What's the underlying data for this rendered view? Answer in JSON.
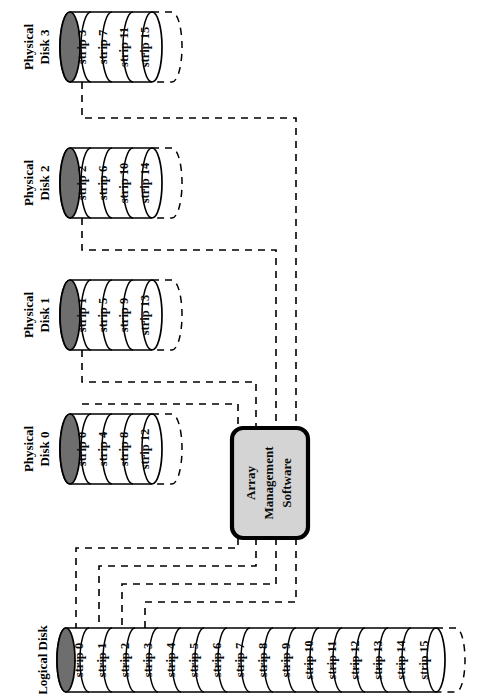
{
  "figure": {
    "orientation": "rotated-90-ccw",
    "background_color": "#ffffff",
    "line_color": "#000000",
    "cap_fill_color": "#6e6e6e",
    "box_fill_color": "#d4d4d4"
  },
  "array_management": {
    "line1": "Array",
    "line2": "Management",
    "line3": "Software"
  },
  "physical_disks": [
    {
      "title_line1": "Physical",
      "title_line2": "Disk 3",
      "strips": [
        "strip 3",
        "strip 7",
        "strip 11",
        "strip 15"
      ]
    },
    {
      "title_line1": "Physical",
      "title_line2": "Disk 2",
      "strips": [
        "strip 2",
        "strip 6",
        "strip 10",
        "strip 14"
      ]
    },
    {
      "title_line1": "Physical",
      "title_line2": "Disk 1",
      "strips": [
        "strip 1",
        "strip 5",
        "strip 9",
        "strip 13"
      ]
    },
    {
      "title_line1": "Physical",
      "title_line2": "Disk 0",
      "strips": [
        "strip 0",
        "strip 4",
        "strip 8",
        "strip 12"
      ]
    }
  ],
  "logical_disk": {
    "title": "Logical Disk",
    "strips": [
      "strip 0",
      "strip 1",
      "strip 2",
      "strip 3",
      "strip 4",
      "strip 5",
      "strip 6",
      "strip 7",
      "strip 8",
      "strip 9",
      "strip 10",
      "strip 11",
      "strip 12",
      "strip 13",
      "strip 14",
      "strip 15"
    ]
  }
}
